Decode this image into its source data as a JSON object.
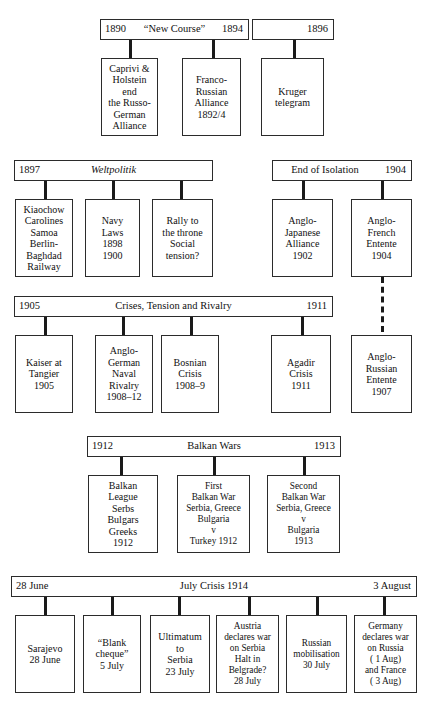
{
  "diagram": {
    "rows": [
      {
        "id": "row-new-course",
        "bars": [
          {
            "left": "1890",
            "center": "“New Course”",
            "right": "1894",
            "italic": false
          },
          {
            "left": "",
            "center": "",
            "right": "1896",
            "italic": false
          }
        ],
        "boxes": [
          {
            "text": "Caprivi &\nHolstein\nend\nthe Russo-\nGerman\nAlliance"
          },
          {
            "text": "Franco-\nRussian\nAlliance\n1892/4"
          },
          {
            "text": "Kruger\ntelegram"
          }
        ]
      },
      {
        "id": "row-weltpolitik",
        "bars": [
          {
            "left": "1897",
            "center": "Weltpolitik",
            "right": "",
            "italic": true
          },
          {
            "left": "",
            "center": "End of Isolation",
            "right": "1904",
            "italic": false
          }
        ],
        "boxes": [
          {
            "text": "Kiaochow\nCarolines\nSamoa\nBerlin-\nBaghdad\nRailway"
          },
          {
            "text": "Navy\nLaws\n1898\n1900"
          },
          {
            "text": "Rally to\nthe throne\nSocial\ntension?"
          },
          {
            "text": "Anglo-\nJapanese\nAlliance\n1902"
          },
          {
            "text": "Anglo-\nFrench\nEntente\n1904"
          }
        ]
      },
      {
        "id": "row-crises",
        "bars": [
          {
            "left": "1905",
            "center": "Crises, Tension and Rivalry",
            "right": "1911",
            "italic": false
          }
        ],
        "boxes": [
          {
            "text": "Kaiser at\nTangier\n1905"
          },
          {
            "text": "Anglo-\nGerman\nNaval\nRivalry\n1908–12"
          },
          {
            "text": "Bosnian\nCrisis\n1908–9"
          },
          {
            "text": "Agadir\nCrisis\n1911"
          },
          {
            "text": "Anglo-\nRussian\nEntente\n1907"
          }
        ]
      },
      {
        "id": "row-balkan-wars",
        "bars": [
          {
            "left": "1912",
            "center": "Balkan Wars",
            "right": "1913",
            "italic": false
          }
        ],
        "boxes": [
          {
            "text": "Balkan\nLeague\nSerbs\nBulgars\nGreeks\n1912"
          },
          {
            "text": "First\nBalkan War\nSerbia, Greece\nBulgaria\nv\nTurkey 1912"
          },
          {
            "text": "Second\nBalkan War\nSerbia, Greece\nv\nBulgaria\n1913"
          }
        ]
      },
      {
        "id": "row-july-crisis",
        "bars": [
          {
            "left": "28 June",
            "center": "July Crisis 1914",
            "right": "3 August",
            "italic": false
          }
        ],
        "boxes": [
          {
            "text": "Sarajevo\n28 June"
          },
          {
            "text": "“Blank\ncheque”\n5 July"
          },
          {
            "text": "Ultimatum\nto\nSerbia\n23 July"
          },
          {
            "text": "Austria\ndeclares war\non Serbia\nHalt in\nBelgrade?\n28 July"
          },
          {
            "text": "Russian\nmobilisation\n30 July"
          },
          {
            "text": "Germany\ndeclares war\non Russia\n( 1 Aug)\nand France\n( 3 Aug)"
          }
        ]
      }
    ]
  }
}
